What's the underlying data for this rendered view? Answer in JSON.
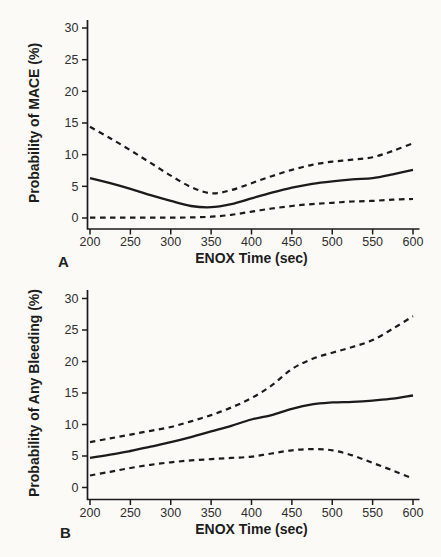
{
  "figure": {
    "background_color": "#fbfaf7",
    "ink_color": "#1b1b1b",
    "panel_labels": {
      "a": "A",
      "b": "B"
    }
  },
  "chart_data": [
    {
      "type": "line",
      "panel_label": "A",
      "title": "",
      "xlabel": "ENOX Time (sec)",
      "ylabel": "Probability of MACE (%)",
      "xlim": [
        200,
        600
      ],
      "ylim": [
        0,
        30
      ],
      "xticks": [
        200,
        250,
        300,
        350,
        400,
        450,
        500,
        550,
        600
      ],
      "yticks": [
        0,
        5,
        10,
        15,
        20,
        25,
        30
      ],
      "grid": false,
      "legend": null,
      "x": [
        200,
        225,
        250,
        275,
        300,
        325,
        350,
        375,
        400,
        425,
        450,
        475,
        500,
        525,
        550,
        575,
        600
      ],
      "series": [
        {
          "name": "predicted-probability",
          "style": "solid",
          "values": [
            6.3,
            5.5,
            4.6,
            3.6,
            2.7,
            1.9,
            1.7,
            2.2,
            3.1,
            4.0,
            4.8,
            5.4,
            5.8,
            6.1,
            6.3,
            6.9,
            7.6
          ]
        },
        {
          "name": "upper-confidence-band",
          "style": "dashed",
          "values": [
            14.4,
            12.6,
            10.7,
            8.7,
            6.7,
            4.9,
            3.9,
            4.4,
            5.5,
            6.6,
            7.6,
            8.4,
            8.9,
            9.2,
            9.6,
            10.6,
            11.8
          ]
        },
        {
          "name": "lower-confidence-band",
          "style": "dashed",
          "values": [
            0.05,
            0.05,
            0.05,
            0.05,
            0.05,
            0.1,
            0.2,
            0.5,
            1.0,
            1.5,
            1.9,
            2.2,
            2.4,
            2.6,
            2.7,
            2.9,
            3.0
          ]
        }
      ]
    },
    {
      "type": "line",
      "panel_label": "B",
      "title": "",
      "xlabel": "ENOX Time (sec)",
      "ylabel": "Probability of Any Bleeding (%)",
      "xlim": [
        200,
        600
      ],
      "ylim": [
        0,
        30
      ],
      "xticks": [
        200,
        250,
        300,
        350,
        400,
        450,
        500,
        550,
        600
      ],
      "yticks": [
        0,
        5,
        10,
        15,
        20,
        25,
        30
      ],
      "grid": false,
      "legend": null,
      "x": [
        200,
        225,
        250,
        275,
        300,
        325,
        350,
        375,
        400,
        425,
        450,
        475,
        500,
        525,
        550,
        575,
        600
      ],
      "series": [
        {
          "name": "predicted-probability",
          "style": "solid",
          "values": [
            4.7,
            5.2,
            5.8,
            6.5,
            7.2,
            8.0,
            8.9,
            9.8,
            10.8,
            11.5,
            12.5,
            13.2,
            13.5,
            13.6,
            13.8,
            14.1,
            14.6
          ]
        },
        {
          "name": "upper-confidence-band",
          "style": "dashed",
          "values": [
            7.2,
            7.8,
            8.4,
            9.0,
            9.6,
            10.5,
            11.5,
            12.7,
            14.2,
            16.2,
            18.8,
            20.4,
            21.4,
            22.3,
            23.4,
            25.2,
            27.2
          ]
        },
        {
          "name": "lower-confidence-band",
          "style": "dashed",
          "values": [
            1.9,
            2.5,
            3.1,
            3.6,
            4.0,
            4.3,
            4.5,
            4.7,
            4.9,
            5.4,
            5.9,
            6.1,
            5.9,
            5.1,
            3.9,
            2.7,
            1.4
          ]
        }
      ]
    }
  ]
}
